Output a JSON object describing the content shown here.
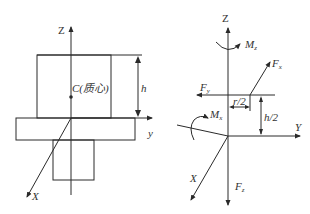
{
  "left_figure": {
    "axis_z": "Z",
    "axis_y": "y",
    "axis_x": "X",
    "center_label": "C(质心)",
    "height_label": "h"
  },
  "right_figure": {
    "axis_z": "Z",
    "axis_y": "Y",
    "axis_x": "X",
    "moment_z": {
      "main": "M",
      "sub": "z"
    },
    "moment_x": {
      "main": "M",
      "sub": "x"
    },
    "force_diag": {
      "main": "F",
      "sub": "x"
    },
    "force_y": {
      "main": "F",
      "sub": "y"
    },
    "force_z": {
      "main": "F",
      "sub": "z"
    },
    "r_half": "r/2",
    "h_half": "h/2"
  }
}
